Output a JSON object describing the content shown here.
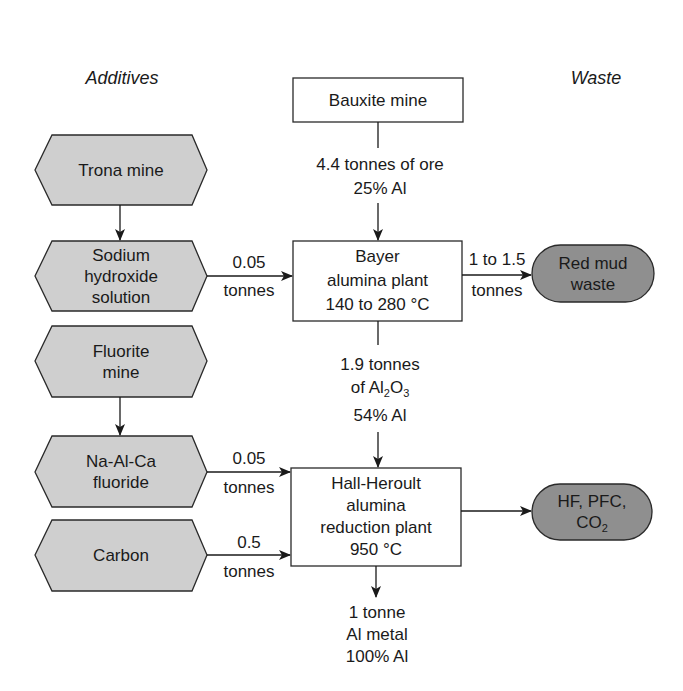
{
  "headings": {
    "left": "Additives",
    "right": "Waste"
  },
  "colors": {
    "additive_fill": "#cfcfcf",
    "waste_fill": "#8f8f8f",
    "process_fill": "#ffffff",
    "stroke": "#2a2a2a",
    "background": "#ffffff"
  },
  "process": {
    "bauxite": {
      "label": "Bauxite mine"
    },
    "bayer": {
      "line1": "Bayer",
      "line2": "alumina plant",
      "line3": "140 to 280 °C"
    },
    "hall": {
      "line1": "Hall-Heroult",
      "line2": "alumina",
      "line3": "reduction plant",
      "line4": "950 °C"
    }
  },
  "flows": {
    "ore": {
      "line1": "4.4 tonnes of ore",
      "line2": "25% Al"
    },
    "alumina": {
      "line1": "1.9 tonnes",
      "line2_prefix": "of Al",
      "line2_sub1": "2",
      "line2_mid": "O",
      "line2_sub2": "3",
      "line3": "54% Al"
    },
    "output": {
      "line1": "1 tonne",
      "line2": "Al metal",
      "line3": "100% Al"
    },
    "sodium_to_bayer": {
      "top": "0.05",
      "bottom": "tonnes"
    },
    "bayer_to_redmud": {
      "top": "1 to 1.5",
      "bottom": "tonnes"
    },
    "fluoride_to_hall": {
      "top": "0.05",
      "bottom": "tonnes"
    },
    "carbon_to_hall": {
      "top": "0.5",
      "bottom": "tonnes"
    }
  },
  "additives": [
    {
      "id": "trona",
      "lines": [
        "Trona mine"
      ]
    },
    {
      "id": "sodium",
      "lines": [
        "Sodium",
        "hydroxide",
        "solution"
      ]
    },
    {
      "id": "fluorite",
      "lines": [
        "Fluorite",
        "mine"
      ]
    },
    {
      "id": "naalca",
      "lines": [
        "Na-Al-Ca",
        "fluoride"
      ]
    },
    {
      "id": "carbon",
      "lines": [
        "Carbon"
      ]
    }
  ],
  "waste": {
    "redmud": {
      "line1": "Red mud",
      "line2": "waste"
    },
    "gases": {
      "line1": "HF, PFC,",
      "line2_prefix": "CO",
      "line2_sub": "2"
    }
  }
}
